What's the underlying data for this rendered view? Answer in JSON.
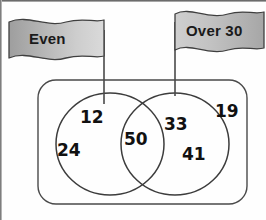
{
  "diagram": {
    "type": "venn-two-set",
    "title": "",
    "sets": [
      {
        "id": "even",
        "flag_label": "Even",
        "position": "left",
        "values": [
          "12",
          "24"
        ]
      },
      {
        "id": "over30",
        "flag_label": "Over 30",
        "position": "right",
        "values": [
          "33",
          "41"
        ]
      }
    ],
    "intersection": {
      "label": "",
      "values": [
        "50"
      ]
    },
    "outside": {
      "label": "",
      "values": [
        "19"
      ]
    },
    "numbers": {
      "left_top": "12",
      "left_bottom": "24",
      "center": "50",
      "right_top": "33",
      "right_bottom": "41",
      "outside": "19"
    },
    "colors": {
      "flag_fill_dark": "#a3a3a3",
      "flag_fill_light": "#dcdcdc",
      "outline": "#3c3c3c",
      "text": "#111111",
      "background": "#ffffff"
    },
    "icons": {
      "left_flag": "flag-banner-icon",
      "right_flag": "flag-banner-icon",
      "universal_set": "rounded-rectangle-icon",
      "left_circle": "circle-icon",
      "right_circle": "circle-icon"
    }
  }
}
